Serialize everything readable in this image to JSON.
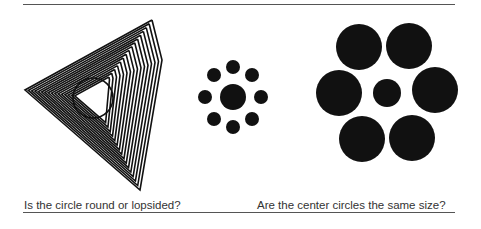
{
  "figures": [
    {
      "id": "lopsided-circle",
      "caption": "Is the circle round or lopsided?"
    },
    {
      "id": "ebbinghaus",
      "caption": "Are the center circles the same size?"
    }
  ],
  "colors": {
    "ink": "#111111",
    "rule": "#555555",
    "caption": "#333333"
  },
  "ebbinghaus": {
    "small": {
      "center": [
        233,
        97
      ],
      "center_r": 13,
      "outer_r": 7,
      "outer": [
        [
          233,
          67
        ],
        [
          214,
          75
        ],
        [
          252,
          75
        ],
        [
          205,
          97
        ],
        [
          261,
          97
        ],
        [
          214,
          119
        ],
        [
          252,
          119
        ],
        [
          233,
          127
        ]
      ]
    },
    "large": {
      "center": [
        387,
        93
      ],
      "center_r": 14,
      "outer_r": 23,
      "outer": [
        [
          359,
          47
        ],
        [
          409,
          46
        ],
        [
          339,
          93
        ],
        [
          435,
          90
        ],
        [
          362,
          139
        ],
        [
          412,
          138
        ]
      ]
    }
  }
}
